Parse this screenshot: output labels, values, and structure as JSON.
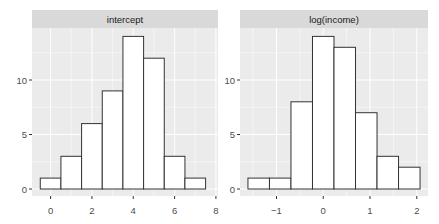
{
  "chart_data": [
    {
      "type": "bar",
      "title": "intercept",
      "xlabel": "",
      "ylabel": "",
      "bins": [
        [
          -0.5,
          0.5
        ],
        [
          0.5,
          1.5
        ],
        [
          1.5,
          2.5
        ],
        [
          2.5,
          3.5
        ],
        [
          3.5,
          4.5
        ],
        [
          4.5,
          5.5
        ],
        [
          5.5,
          6.5
        ],
        [
          6.5,
          7.5
        ]
      ],
      "values": [
        1,
        3,
        6,
        9,
        14,
        12,
        3,
        1
      ],
      "xticks": [
        "0",
        "2",
        "4",
        "6",
        "8"
      ],
      "xtick_values": [
        0,
        2,
        4,
        6,
        8
      ],
      "yticks": [
        "0",
        "5",
        "10"
      ],
      "ytick_values": [
        0,
        5,
        10
      ],
      "xlim": [
        -0.9,
        8.1
      ],
      "ylim": [
        0,
        14.7
      ],
      "grid": true
    },
    {
      "type": "bar",
      "title": "log(income)",
      "xlabel": "",
      "ylabel": "",
      "bins": [
        [
          -1.61,
          -1.15
        ],
        [
          -1.15,
          -0.69
        ],
        [
          -0.69,
          -0.23
        ],
        [
          -0.23,
          0.23
        ],
        [
          0.23,
          0.69
        ],
        [
          0.69,
          1.15
        ],
        [
          1.15,
          1.61
        ],
        [
          1.61,
          2.07
        ]
      ],
      "values": [
        1,
        1,
        8,
        14,
        13,
        7,
        3,
        2
      ],
      "xticks": [
        "-1",
        "0",
        "1",
        "2"
      ],
      "xtick_values": [
        -1,
        0,
        1,
        2
      ],
      "yticks": [
        "0",
        "5",
        "10"
      ],
      "ytick_values": [
        0,
        5,
        10
      ],
      "xlim": [
        -1.78,
        2.24
      ],
      "ylim": [
        0,
        14.7
      ],
      "grid": true
    }
  ],
  "colors": {
    "panel_bg": "#ebebeb",
    "strip_bg": "#d9d9d9",
    "grid": "#ffffff",
    "bar_fill": "#ffffff",
    "bar_stroke": "#333333",
    "tick_text": "#4d4d4d"
  }
}
